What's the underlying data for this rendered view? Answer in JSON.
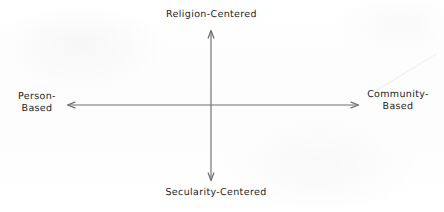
{
  "diagram": {
    "type": "two-axis-conceptual-matrix",
    "title": "",
    "background_color": "#fdfdfd",
    "line_color": "#6e6e73",
    "text_color": "#1f1f22",
    "axes": {
      "vertical": {
        "top_label": "Religion-Centered",
        "bottom_label": "Secularity-Centered",
        "double_headed": true
      },
      "horizontal": {
        "left_label_line1": "Person-",
        "left_label_line2": "Based",
        "right_label_line1": "Community-",
        "right_label_line2": "Based",
        "double_headed": true
      }
    },
    "origin": {
      "x": 211,
      "y": 105
    }
  }
}
